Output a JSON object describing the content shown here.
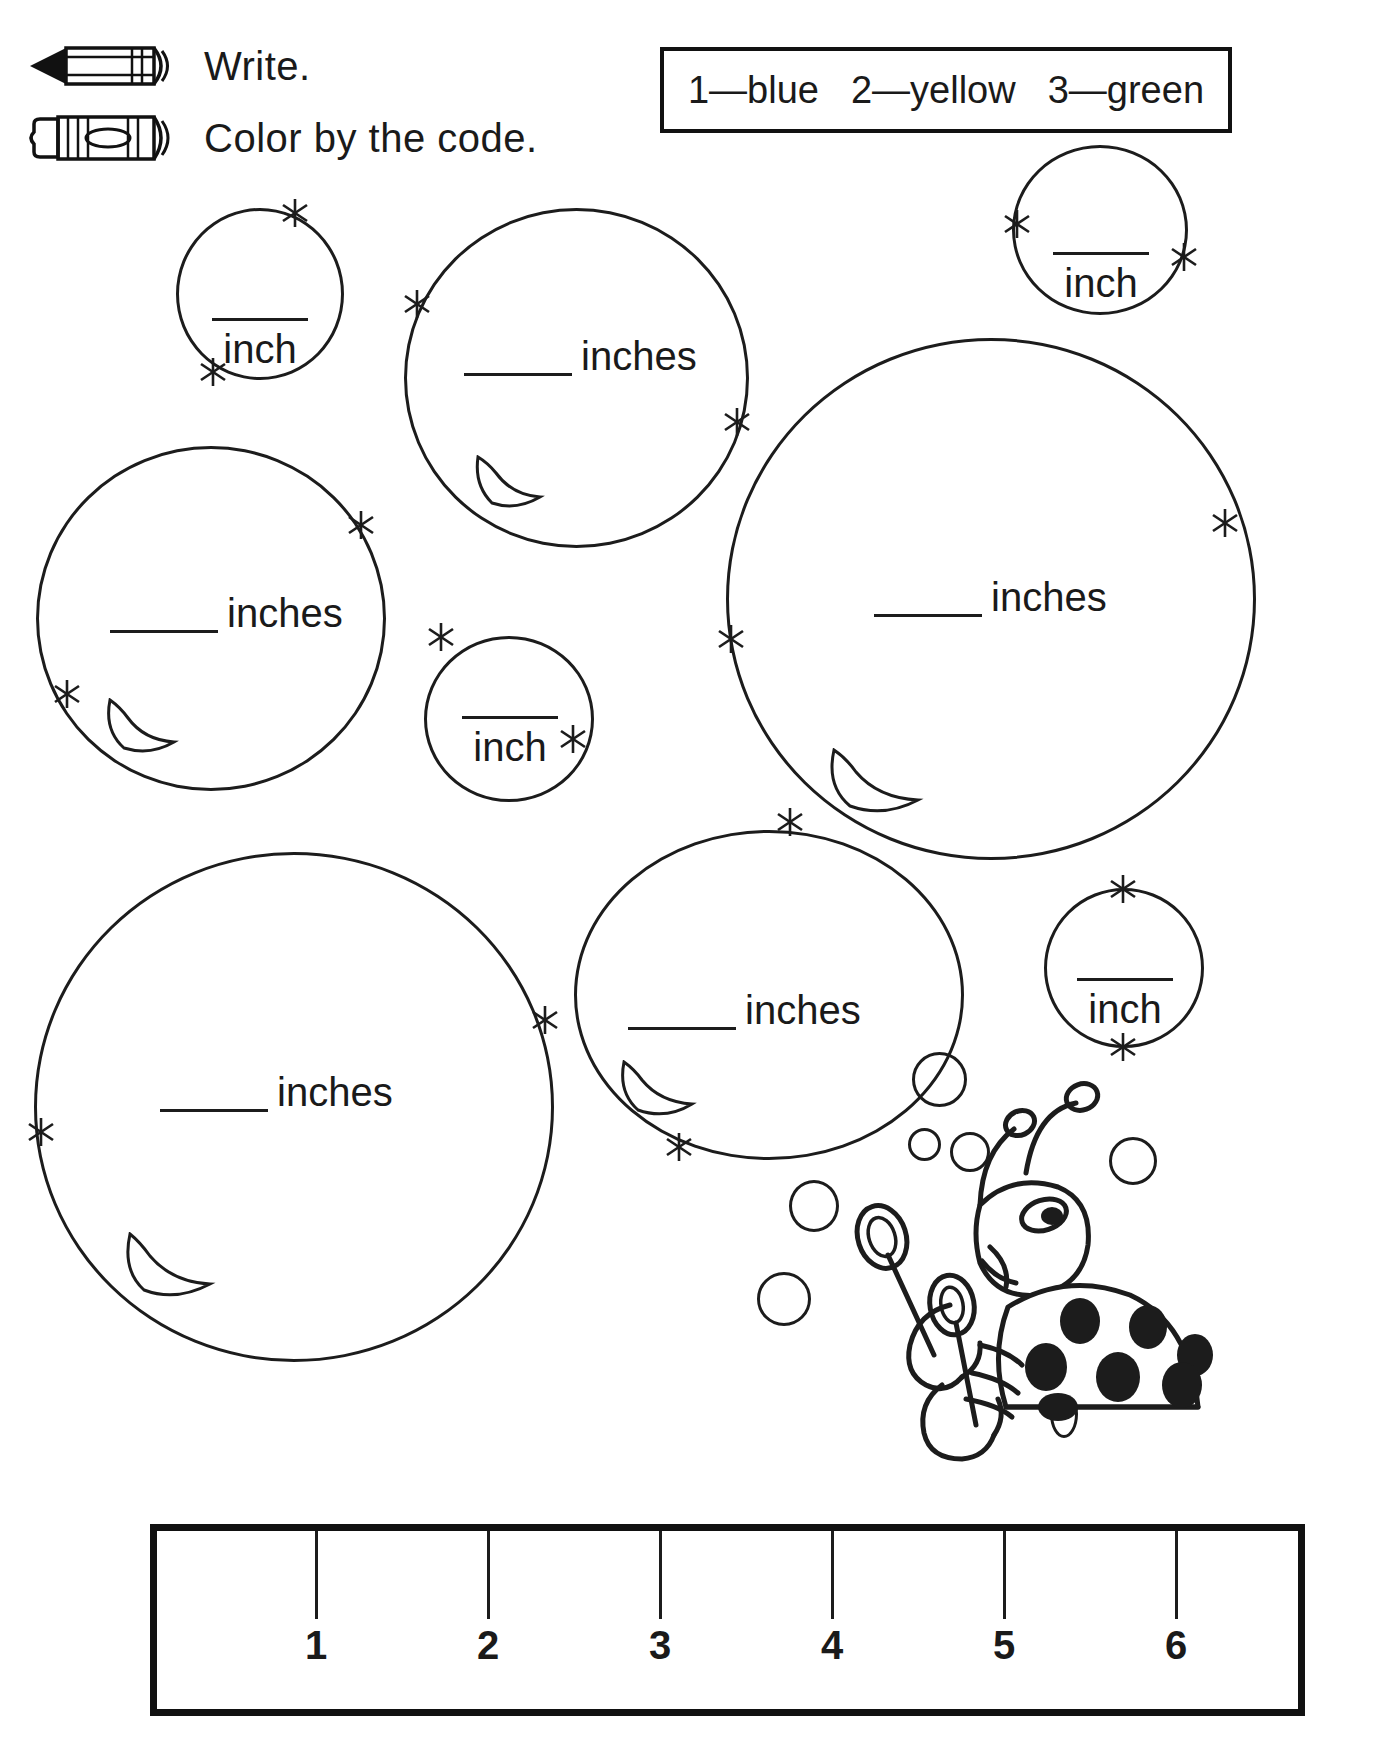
{
  "instructions": [
    {
      "icon": "pencil-icon",
      "label": "Write."
    },
    {
      "icon": "crayon-icon",
      "label": "Color by the code."
    }
  ],
  "color_code": {
    "items": [
      {
        "number": "1",
        "dash": "—",
        "color_name": "blue",
        "text": "1—blue"
      },
      {
        "number": "2",
        "dash": "—",
        "color_name": "yellow",
        "text": "2—yellow"
      },
      {
        "number": "3",
        "dash": "—",
        "color_name": "green",
        "text": "3—green"
      }
    ]
  },
  "bubbles": [
    {
      "id": "bubble-small-top-left",
      "unit": "inch",
      "layout": "stacked"
    },
    {
      "id": "bubble-large-top-center",
      "unit": "inches",
      "layout": "inline"
    },
    {
      "id": "bubble-small-top-right",
      "unit": "inch",
      "layout": "stacked"
    },
    {
      "id": "bubble-large-mid-left",
      "unit": "inches",
      "layout": "inline"
    },
    {
      "id": "bubble-small-center",
      "unit": "inch",
      "layout": "stacked"
    },
    {
      "id": "bubble-large-mid-right",
      "unit": "inches",
      "layout": "inline"
    },
    {
      "id": "bubble-large-bottom-left",
      "unit": "inches",
      "layout": "inline"
    },
    {
      "id": "bubble-large-bottom-center",
      "unit": "inches",
      "layout": "inline"
    },
    {
      "id": "bubble-small-bottom-right",
      "unit": "inch",
      "layout": "stacked"
    }
  ],
  "ruler": {
    "numbers": [
      "1",
      "2",
      "3",
      "4",
      "5",
      "6"
    ],
    "unit": "inches",
    "max": 6
  },
  "colors": {
    "ink": "#1c1c1c",
    "heavy_ink": "#111111",
    "paper": "#ffffff"
  }
}
